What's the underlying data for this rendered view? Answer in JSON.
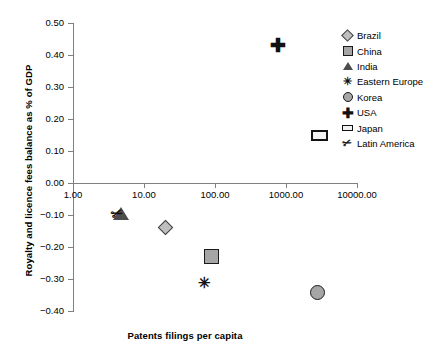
{
  "chart_data": {
    "type": "scatter",
    "title": "",
    "xlabel": "Patents filings per capita",
    "ylabel": "Royalty and licence fees balance as % of GDP",
    "xscale": "log",
    "xlim": [
      1.0,
      10000.0
    ],
    "ylim": [
      -0.4,
      0.5
    ],
    "xticks": [
      "1.00",
      "10.00",
      "100.00",
      "1000.00",
      "10000.00"
    ],
    "xtick_values": [
      1,
      10,
      100,
      1000,
      10000
    ],
    "yticks": [
      "0.50",
      "0.40",
      "0.30",
      "0.20",
      "0.10",
      "0.00",
      "-0.10",
      "-0.20",
      "-0.30",
      "-0.40"
    ],
    "ytick_values": [
      0.5,
      0.4,
      0.3,
      0.2,
      0.1,
      0.0,
      -0.1,
      -0.2,
      -0.3,
      -0.4
    ],
    "grid": false,
    "legend_position": "right",
    "series": [
      {
        "name": "Brazil",
        "marker": "diamond",
        "x": 20,
        "y": -0.14
      },
      {
        "name": "China",
        "marker": "square",
        "x": 92,
        "y": -0.23
      },
      {
        "name": "India",
        "marker": "triangle",
        "x": 4.7,
        "y": -0.095
      },
      {
        "name": "Eastern Europe",
        "marker": "asterisk",
        "x": 70,
        "y": -0.31
      },
      {
        "name": "Korea",
        "marker": "circle",
        "x": 2800,
        "y": -0.345
      },
      {
        "name": "USA",
        "marker": "plus",
        "x": 770,
        "y": 0.43
      },
      {
        "name": "Japan",
        "marker": "rect",
        "x": 3000,
        "y": 0.15
      },
      {
        "name": "Latin America",
        "marker": "slash",
        "x": 4.2,
        "y": -0.095
      }
    ]
  },
  "legend": {
    "items": [
      {
        "label": "Brazil",
        "marker": "diamond"
      },
      {
        "label": "China",
        "marker": "square"
      },
      {
        "label": "India",
        "marker": "triangle"
      },
      {
        "label": "Eastern Europe",
        "marker": "asterisk"
      },
      {
        "label": "Korea",
        "marker": "circle"
      },
      {
        "label": "USA",
        "marker": "plus"
      },
      {
        "label": "Japan",
        "marker": "rect"
      },
      {
        "label": "Latin America",
        "marker": "slash"
      }
    ]
  },
  "glyphs": {
    "plus": "✚",
    "asterisk": "✳",
    "slash": "✂"
  }
}
